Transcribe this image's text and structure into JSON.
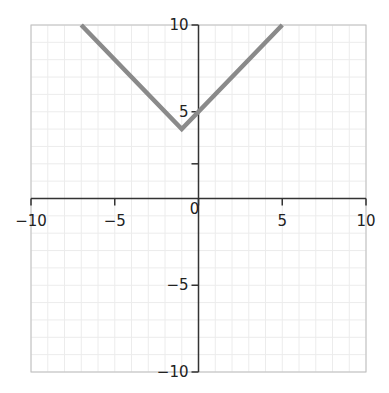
{
  "chart_data": {
    "type": "line",
    "title": "",
    "xlabel": "",
    "ylabel": "",
    "xlim": [
      -10,
      10
    ],
    "ylim": [
      -10,
      10
    ],
    "grid": true,
    "grid_step": 1,
    "x_ticks": [
      -10,
      -5,
      0,
      5,
      10
    ],
    "x_tick_labels": [
      "−10",
      "−5",
      "0",
      "5",
      "10"
    ],
    "y_ticks": [
      -10,
      -5,
      5,
      10
    ],
    "y_tick_labels": [
      "−10",
      "−5",
      "5",
      "10"
    ],
    "y_minor_unlabeled_ticks": [
      2
    ],
    "series": [
      {
        "name": "y = |x + 1| + 4",
        "color": "#8a8a8a",
        "x": [
          -7,
          -1,
          5
        ],
        "y": [
          10,
          4,
          10
        ]
      }
    ],
    "legend": null
  },
  "colors": {
    "axis": "#333333",
    "grid": "#ececec",
    "frame": "#bdbdbd",
    "line": "#8a8a8a"
  }
}
